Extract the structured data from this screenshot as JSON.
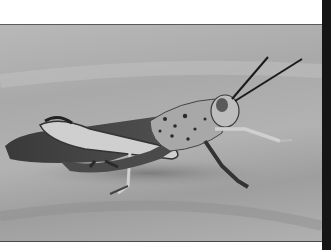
{
  "image": {
    "subject": "grasshopper",
    "style": "grayscale photograph",
    "colors": {
      "background_frame": "#ffffff",
      "right_bar": "#151515",
      "photo_background": "#b0b0b0",
      "insect_dark": "#2a2a2a",
      "insect_light": "#d8d8d8"
    }
  }
}
